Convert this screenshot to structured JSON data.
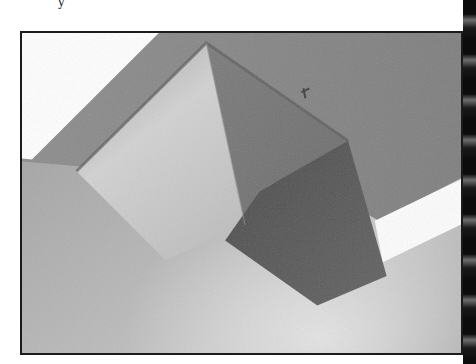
{
  "page": {
    "type": "scanned-book-page",
    "fragment_text": "y"
  },
  "photo": {
    "subject": "cube-box-suspended-at-ceiling-corner",
    "style": "grayscale-halftone",
    "colors": {
      "frame_border": "#1b1b1b",
      "sky_white": "#ffffff",
      "ceiling_gray": "#8a8a8a",
      "wall_gray": "#a6a6a6",
      "cube_light_face": "#cfcfcf",
      "cube_top_face": "#7c7c7c",
      "cube_dark_face": "#555555",
      "stripe_white": "#fdfdfd",
      "binding_dark": "#0c0c0c"
    }
  }
}
